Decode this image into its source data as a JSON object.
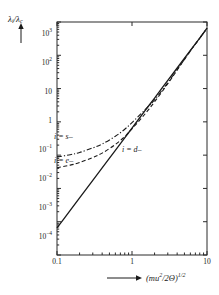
{
  "chart_data": {
    "type": "line",
    "title": "",
    "xlabel": "(mu²/2Θ)^1/2",
    "ylabel": "λ_i/λ_c",
    "xscale": "log",
    "yscale": "log",
    "xlim": [
      0.1,
      10
    ],
    "ylim": [
      0.0001,
      1000
    ],
    "grid": false,
    "legend_position": "inline-annotations",
    "xticks": [
      "0.1",
      "1",
      "10"
    ],
    "xtick_values": [
      0.1,
      1,
      10
    ],
    "yticks": [
      "10⁴",
      "10³",
      "10²",
      "10",
      "1",
      "10⁻¹",
      "10⁻²",
      "10⁻³",
      "10⁻⁴"
    ],
    "ytick_values": [
      1000,
      100,
      10,
      1,
      0.1,
      0.01,
      0.001,
      0.0001
    ],
    "series": [
      {
        "name": "i = d-",
        "style": "solid",
        "label": "i = d–",
        "x": [
          0.1,
          0.15,
          0.2,
          0.3,
          0.4,
          0.6,
          0.8,
          1.0,
          1.5,
          2.0,
          3.0,
          4.0,
          6.0,
          8.0,
          10.0
        ],
        "y": [
          0.00065,
          0.0022,
          0.0052,
          0.0175,
          0.0415,
          0.14,
          0.33,
          0.65,
          2.2,
          5.2,
          17.5,
          41.5,
          140,
          330,
          650
        ]
      },
      {
        "name": "i = e-",
        "style": "dashed",
        "label": "i = e–",
        "x": [
          0.1,
          0.15,
          0.2,
          0.3,
          0.4,
          0.6,
          0.8,
          1.0,
          1.3,
          1.6,
          2.0,
          3.0,
          4.0,
          6.0,
          8.0,
          10.0
        ],
        "y": [
          0.042,
          0.05,
          0.06,
          0.085,
          0.115,
          0.21,
          0.36,
          0.62,
          1.2,
          2.1,
          4.0,
          14.0,
          36.0,
          135,
          325,
          645
        ]
      },
      {
        "name": "i = s-",
        "style": "dashdot",
        "label": "i = s–",
        "x": [
          0.1,
          0.15,
          0.2,
          0.3,
          0.4,
          0.6,
          0.8,
          1.0,
          1.3,
          1.6,
          2.0,
          3.0,
          4.0,
          6.0,
          8.0,
          10.0
        ],
        "y": [
          0.088,
          0.103,
          0.12,
          0.165,
          0.215,
          0.37,
          0.6,
          0.95,
          1.7,
          2.7,
          4.6,
          15.0,
          37.0,
          136,
          326,
          646
        ]
      }
    ],
    "annotations": [
      {
        "text": "i = s–",
        "x_px": 54,
        "y_px": 137
      },
      {
        "text": "i = e–",
        "x_px": 54,
        "y_px": 161
      },
      {
        "text": "i = d–",
        "x_px": 122,
        "y_px": 150
      }
    ]
  },
  "axes": {
    "y_label_main": "λ",
    "y_label_sub1": "i",
    "y_label_mid": "/λ",
    "y_label_sub2": "c",
    "y_arrow": "up-arrow",
    "x_arrow": "right-arrow",
    "x_label_text": "(mu",
    "x_label_sup1": "2",
    "x_label_mid": "/2Θ)",
    "x_label_sup2": "1/2"
  },
  "yticks": [
    {
      "label": "10",
      "exp": "3",
      "value": 1000
    },
    {
      "label": "10",
      "exp": "2",
      "value": 100
    },
    {
      "label": "10",
      "exp": "",
      "value": 10
    },
    {
      "label": "1",
      "exp": "",
      "value": 1
    },
    {
      "label": "10",
      "exp": "−1",
      "value": 0.1
    },
    {
      "label": "10",
      "exp": "−2",
      "value": 0.01
    },
    {
      "label": "10",
      "exp": "−3",
      "value": 0.001
    },
    {
      "label": "10",
      "exp": "−4",
      "value": 0.0001
    }
  ],
  "xticks": [
    {
      "label": "0.1",
      "value": 0.1
    },
    {
      "label": "1",
      "value": 1
    },
    {
      "label": "10",
      "value": 10
    }
  ],
  "colors": {
    "ink": "#1a1a1a",
    "background": "#ffffff",
    "frame": "#2b2b2b"
  }
}
